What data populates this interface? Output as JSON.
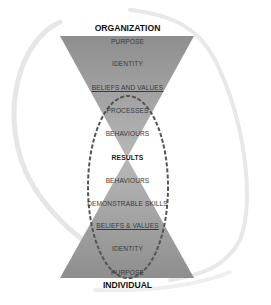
{
  "diagram": {
    "top_title": "ORGANIZATION",
    "bottom_title": "INDIVIDUAL",
    "center_label": "RESULTS",
    "top_triangle": {
      "labels": [
        "PURPOSE",
        "IDENTITY",
        "BELIEFS AND VALUES",
        "PROCESSES",
        "BEHAVIOURS"
      ]
    },
    "bottom_triangle": {
      "labels": [
        "BEHAVIOURS",
        "DEMONSTRABLE SKILLS",
        "BELIEFS & VALUES",
        "IDENTITY",
        "PURPOSE"
      ]
    },
    "colors": {
      "triangle_fill": "#9a9a9a",
      "triangle_fill_light": "#b4b4b4",
      "ellipse_stroke": "#555555",
      "swoosh": "#e4e4e4",
      "title_text": "#111111",
      "label_text": "#3a3a3a"
    }
  }
}
